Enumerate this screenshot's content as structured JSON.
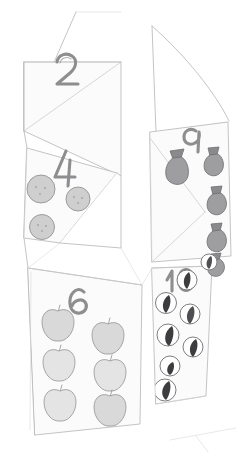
{
  "artwork": {
    "title": "Folded Paper Counting Panels",
    "medium": "graphite pencil sketch",
    "background_color": "#ffffff",
    "line_color": "#b9b9bb",
    "canvas": {
      "width": 240,
      "height": 458
    }
  },
  "panels": [
    {
      "id": "panel-2",
      "number_label": "2",
      "position": "upper-left",
      "item_icon": "none",
      "item_count": 0,
      "note": "numeral only, no counted objects visible"
    },
    {
      "id": "panel-blank-top-right",
      "number_label": "",
      "position": "upper-right",
      "item_icon": "none",
      "item_count": 0,
      "note": "blank folded flap"
    },
    {
      "id": "panel-4",
      "number_label": "4",
      "position": "middle-left",
      "item_icon": "ball-face-icon",
      "item_count": 4,
      "item_color": "#cfcfcf"
    },
    {
      "id": "panel-9",
      "number_label": "9",
      "position": "middle-right",
      "item_icon": "money-bag-icon",
      "item_count": 9,
      "item_color": "#9e9ea0"
    },
    {
      "id": "panel-6",
      "number_label": "6",
      "position": "lower-left",
      "item_icon": "apple-icon",
      "item_count": 6,
      "item_color": "#d9d9d9"
    },
    {
      "id": "panel-10",
      "number_label": "10",
      "position": "lower-right",
      "item_icon": "bean-circle-icon",
      "item_count": 10,
      "item_color": "#3d3d40"
    }
  ],
  "labels": {
    "two": "2",
    "four": "4",
    "six": "6",
    "nine": "9",
    "ten": "10"
  }
}
